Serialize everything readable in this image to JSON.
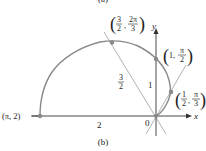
{
  "figure": {
    "top_label_partial": "(a)",
    "caption": "(b)",
    "curve": "r = 1 - cos θ (cardioid, upper half)",
    "axes": {
      "x_label": "x",
      "y_label": "y",
      "origin_label": "0"
    },
    "points": [
      {
        "name": "pi-2",
        "label": "(π, 2)"
      },
      {
        "name": "three-halves-two-pi-thirds",
        "label_r_num": "3",
        "label_r_den": "2",
        "label_t_num": "2π",
        "label_t_den": "3"
      },
      {
        "name": "one-pi-halves",
        "label_r": "1",
        "label_t_num": "π",
        "label_t_den": "2"
      },
      {
        "name": "half-pi-thirds",
        "label_r_num": "1",
        "label_r_den": "2",
        "label_t_num": "π",
        "label_t_den": "3"
      }
    ],
    "segment_labels": {
      "radius_pi": "2",
      "radius_pi_half": "1",
      "radius_two_pi_thirds_num": "3",
      "radius_two_pi_thirds_den": "2"
    },
    "colors": {
      "curve": "#8a8a8a",
      "axis": "#333333",
      "guide": "#a8a8a8",
      "point": "#888888",
      "text": "#222222"
    }
  }
}
